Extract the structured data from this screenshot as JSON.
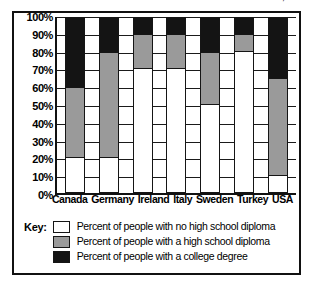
{
  "title": {
    "text": "Educational Attainment in Selected Countries, 1991",
    "note": "cropped at top edge of screenshot"
  },
  "legend": {
    "key_label": "Key:",
    "entries": [
      {
        "swatch": "white-swatch",
        "label": "Percent of people with no high school diploma",
        "color": "#ffffff"
      },
      {
        "swatch": "gray-swatch",
        "label": "Percent of people with a high school diploma",
        "color": "#9a9a9a"
      },
      {
        "swatch": "black-swatch",
        "label": "Percent of people with a college degree",
        "color": "#141414"
      }
    ]
  },
  "chart_data": {
    "type": "bar",
    "subtype": "stacked-100-percent",
    "title": "Educational Attainment in Selected Countries, 1991",
    "xlabel": "",
    "ylabel": "",
    "ylim": [
      0,
      100
    ],
    "grid": true,
    "legend_position": "bottom",
    "categories": [
      "Canada",
      "Germany",
      "Ireland",
      "Italy",
      "Sweden",
      "Turkey",
      "USA"
    ],
    "ytick_labels": [
      "0%",
      "10%",
      "20%",
      "30%",
      "40%",
      "50%",
      "60%",
      "70%",
      "80%",
      "90%",
      "100%"
    ],
    "ytick_values": [
      0,
      10,
      20,
      30,
      40,
      50,
      60,
      70,
      80,
      90,
      100
    ],
    "stack_order_bottom_to_top": [
      "no high school diploma",
      "high school diploma",
      "college degree"
    ],
    "series": [
      {
        "name": "Percent of people with no high school diploma",
        "color": "#ffffff",
        "values": [
          20,
          20,
          70,
          70,
          50,
          80,
          10
        ]
      },
      {
        "name": "Percent of people with a high school diploma",
        "color": "#9a9a9a",
        "values": [
          40,
          60,
          20,
          20,
          30,
          10,
          55
        ]
      },
      {
        "name": "Percent of people with a college degree",
        "color": "#141414",
        "values": [
          40,
          20,
          10,
          10,
          20,
          10,
          35
        ]
      }
    ]
  }
}
